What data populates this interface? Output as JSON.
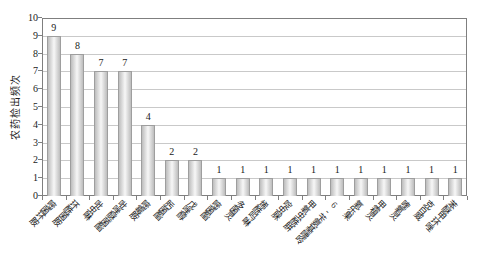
{
  "chart_data": {
    "type": "bar",
    "title": "",
    "xlabel": "",
    "ylabel": "农药检出频次",
    "categories": [
      "嘧菌环胺",
      "环酰菌胺",
      "吡虫啉",
      "吡唑醚菌酯",
      "嘧霉胺",
      "肟菌酯",
      "戊唑醇",
      "嘧菌酯",
      "多菌灵",
      "烯酰吗啉",
      "啶虫脒",
      "甲氧虫酰肼",
      "6-苄氨基嘌呤",
      "氧乐果",
      "甲霜灵",
      "喹氧灵",
      "克百威",
      "苯醚甲环唑"
    ],
    "values": [
      9,
      8,
      7,
      7,
      4,
      2,
      2,
      1,
      1,
      1,
      1,
      1,
      1,
      1,
      1,
      1,
      1,
      1
    ],
    "data_labels": [
      9,
      8,
      7,
      7,
      4,
      2,
      2,
      1,
      1,
      1,
      1,
      1,
      1,
      1,
      1,
      1,
      1,
      1
    ],
    "ylim": [
      0,
      10
    ],
    "yticks": [
      0,
      1,
      2,
      3,
      4,
      5,
      6,
      7,
      8,
      9,
      10
    ],
    "grid": "horizontal",
    "legend_position": "none",
    "colors": {
      "background": "#ffffff",
      "plot_border": "#7f7f7f",
      "gridline": "#c9c9c9",
      "bar_border": "#9e9e9e",
      "bar_fill_edge": "#bdbdbd",
      "bar_fill_center": "#f7f7f7",
      "text": "#1a1a1a"
    }
  }
}
